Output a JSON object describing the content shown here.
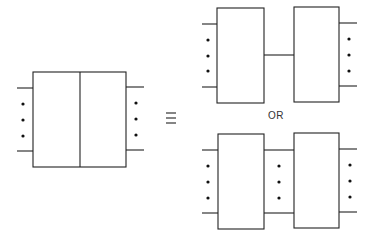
{
  "diagram": {
    "equivalence_symbol": "≡",
    "or_label": "OR",
    "stroke_color": "#222222",
    "left": {
      "description": "Single two-port network block divided by a vertical line (two sub-blocks combined)",
      "ports_left": "n leads (shown with 2 lines and 3 dots)",
      "ports_right": "n leads (shown with 2 lines and 3 dots)"
    },
    "right_top": {
      "description": "Two blocks in cascade connected by a single line"
    },
    "right_bottom": {
      "description": "Two blocks in cascade connected by multiple lines (2 lines and 3 dots)"
    }
  }
}
